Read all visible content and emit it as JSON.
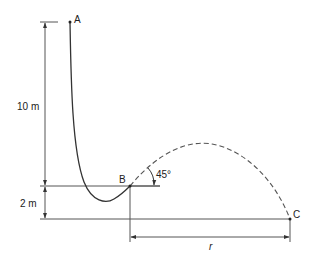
{
  "diagram": {
    "type": "physics-projectile-ramp",
    "points": {
      "A": {
        "label": "A",
        "x": 70,
        "y": 22
      },
      "B": {
        "label": "B",
        "x": 130,
        "y": 186
      },
      "C": {
        "label": "C",
        "x": 290,
        "y": 219
      }
    },
    "dimensions": {
      "height_AB": {
        "label": "10 m"
      },
      "height_B_ground": {
        "label": "2 m"
      },
      "range": {
        "label": "r"
      }
    },
    "angle": {
      "label": "45°",
      "at": "B"
    },
    "colors": {
      "stroke": "#333333",
      "dim_stroke": "#555555",
      "background": "#ffffff"
    }
  }
}
